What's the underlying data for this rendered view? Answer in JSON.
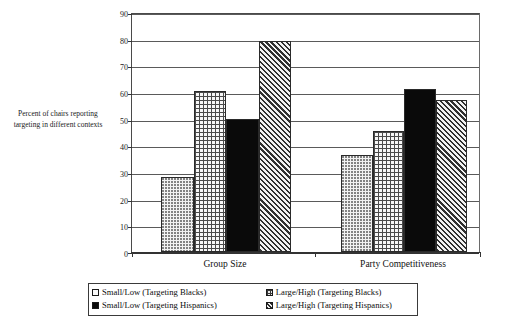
{
  "chart_data": {
    "type": "bar",
    "title": "",
    "xlabel": "",
    "ylabel": "Percent of chairs reporting targeting in different contexts",
    "ylim": [
      0,
      90
    ],
    "ytick_labels": [
      "0",
      "10",
      "20",
      "30",
      "40",
      "50",
      "60",
      "70",
      "80",
      "90"
    ],
    "yticks": [
      0,
      10,
      20,
      30,
      40,
      50,
      60,
      70,
      80,
      90
    ],
    "grid": true,
    "legend_position": "bottom",
    "categories": [
      "Group Size",
      "Party Competitiveness"
    ],
    "series": [
      {
        "name": "Small/Low (Targeting Blacks)",
        "pattern": "dots",
        "values": [
          28,
          36.5
        ]
      },
      {
        "name": "Large/High (Targeting Blacks)",
        "pattern": "grid",
        "values": [
          60.5,
          45.5
        ]
      },
      {
        "name": "Small/Low (Targeting Hispanics)",
        "pattern": "solid-black",
        "values": [
          50,
          61
        ]
      },
      {
        "name": "Large/High (Targeting Hispanics)",
        "pattern": "diagonal-hatch",
        "values": [
          79,
          57
        ]
      }
    ]
  },
  "axis": {
    "y_title": "Percent of chairs reporting targeting in different contexts"
  },
  "legend": {
    "items": [
      {
        "label": "Small/Low (Targeting Blacks)",
        "swatch": "dots"
      },
      {
        "label": "Large/High (Targeting Blacks)",
        "swatch": "grid"
      },
      {
        "label": "Small/Low (Targeting Hispanics)",
        "swatch": "solid-black"
      },
      {
        "label": "Large/High (Targeting Hispanics)",
        "swatch": "diagonal-hatch"
      }
    ]
  }
}
